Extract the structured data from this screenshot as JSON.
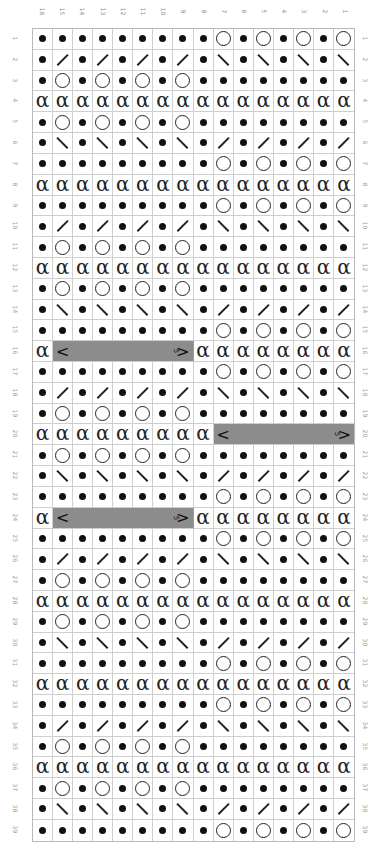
{
  "chart": {
    "type": "knitting-chart",
    "column_labels": [
      "16",
      "15",
      "14",
      "13",
      "12",
      "11",
      "10",
      "9",
      "8",
      "7",
      "6",
      "5",
      "4",
      "3",
      "2",
      "1"
    ],
    "row_labels": [
      "1",
      "2",
      "3",
      "4",
      "5",
      "6",
      "7",
      "8",
      "9",
      "10",
      "11",
      "12",
      "13",
      "14",
      "15",
      "16",
      "17",
      "18",
      "19",
      "20",
      "21",
      "22",
      "23",
      "24",
      "25",
      "26",
      "27",
      "28",
      "29",
      "30",
      "31",
      "32",
      "33",
      "34",
      "35",
      "36",
      "37",
      "38",
      "39"
    ],
    "colors": {
      "cable_fill": "#8c8c8c",
      "grid_line": "#cfcfcf",
      "symbol": "#111111",
      "label": "#999999"
    },
    "symbol_legend": {
      "p": "dot (purl)",
      "o": "circle (yarn over)",
      "r": "right-leaning slash",
      "l": "left-leaning slash",
      "t": "twisted stitch (alpha)",
      "cable": "gray cable spanning cells with < and >5"
    },
    "cable_label_left": "<",
    "cable_label_right": ">",
    "cable_label_num": "5",
    "rows": [
      {
        "n": "1",
        "cells": "ppppppppp o p o p o p o"
      },
      {
        "n": "2",
        "cells": "p r p r p r p r p l p l p l p l"
      },
      {
        "n": "3",
        "cells": "p o p o p o p o p p p p p p p p"
      },
      {
        "n": "4",
        "cells": "t t t t t t t t t t t t t t t t"
      },
      {
        "n": "5",
        "cells": "p o p o p o p o p p p p p p p p"
      },
      {
        "n": "6",
        "cells": "p l p l p l p l p r p r p r p r"
      },
      {
        "n": "7",
        "cells": "p p p p p p p p p o p o p o p o"
      },
      {
        "n": "8",
        "cells": "t t t t t t t t t t t t t t t t"
      },
      {
        "n": "9",
        "cells": "p p p p p p p p p o p o p o p o"
      },
      {
        "n": "10",
        "cells": "p r p r p r p r p l p l p l p l"
      },
      {
        "n": "11",
        "cells": "p o p o p o p o p p p p p p p p"
      },
      {
        "n": "12",
        "cells": "t t t t t t t t t t t t t t t t"
      },
      {
        "n": "13",
        "cells": "p o p o p o p o p p p p p p p p"
      },
      {
        "n": "14",
        "cells": "p l p l p l p l p r p r p r p r"
      },
      {
        "n": "15",
        "cells": "p p p p p p p p p o p o p o p o"
      },
      {
        "n": "16",
        "cells": "t C7 t t t t t t t t"
      },
      {
        "n": "17",
        "cells": "p p p p p p p p p o p o p o p o"
      },
      {
        "n": "18",
        "cells": "p r p r p r p r p l p l p l p l"
      },
      {
        "n": "19",
        "cells": "p o p o p o p o p p p p p p p p"
      },
      {
        "n": "20",
        "cells": "t t t t t t t t t C7"
      },
      {
        "n": "21",
        "cells": "p o p o p o p o p p p p p p p p"
      },
      {
        "n": "22",
        "cells": "p l p l p l p l p r p r p r p r"
      },
      {
        "n": "23",
        "cells": "p p p p p p p p p o p o p o p o"
      },
      {
        "n": "24",
        "cells": "t C7 t t t t t t t t"
      },
      {
        "n": "25",
        "cells": "p p p p p p p p p o p o p o p o"
      },
      {
        "n": "26",
        "cells": "p r p r p r p r p l p l p l p l"
      },
      {
        "n": "27",
        "cells": "p o p o p o p o p p p p p p p p"
      },
      {
        "n": "28",
        "cells": "t t t t t t t t t t t t t t t t"
      },
      {
        "n": "29",
        "cells": "p o p o p o p o p p p p p p p p"
      },
      {
        "n": "30",
        "cells": "p l p l p l p l p r p r p r p r"
      },
      {
        "n": "31",
        "cells": "p p p p p p p p p o p o p o p o"
      },
      {
        "n": "32",
        "cells": "t t t t t t t t t t t t t t t t"
      },
      {
        "n": "33",
        "cells": "p p p p p p p p p o p o p o p o"
      },
      {
        "n": "34",
        "cells": "p r p r p r p r p l p l p l p l"
      },
      {
        "n": "35",
        "cells": "p o p o p o p o p p p p p p p p"
      },
      {
        "n": "36",
        "cells": "t t t t t t t t t t t t t t t t"
      },
      {
        "n": "37",
        "cells": "p o p o p o p o p p p p p p p p"
      },
      {
        "n": "38",
        "cells": "p l p l p l p l p r p r p r p r"
      },
      {
        "n": "39",
        "cells": "p p p p p p p p p o p o p o p o"
      }
    ]
  }
}
